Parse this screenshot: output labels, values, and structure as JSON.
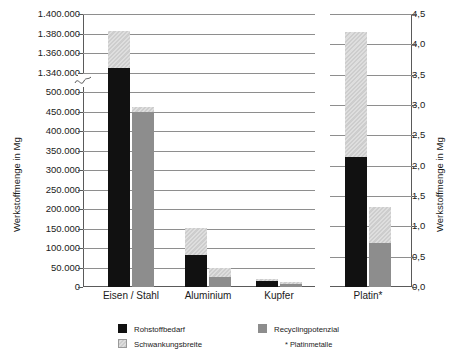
{
  "chart_data": {
    "type": "bar",
    "title": "",
    "categories": [
      "Eisen / Stahl",
      "Aluminium",
      "Kupfer",
      "Platin*"
    ],
    "series": [
      {
        "name": "Rohstoffbedarf",
        "color": "#111111",
        "values": [
          1345000,
          82000,
          15000,
          2.15
        ]
      },
      {
        "name": "Recyclingpotenzial",
        "color": "#8d8d8d",
        "values": [
          450000,
          25000,
          8000,
          0.72
        ]
      },
      {
        "name": "Schwankungsbreite",
        "color": "#d3d3d3",
        "upper_on_rohstoffbedarf": [
          1383000,
          152000,
          20000,
          4.2
        ],
        "upper_on_recyclingpotenzial": [
          462000,
          48000,
          12000,
          1.32
        ]
      }
    ],
    "left_axis": {
      "label": "Werkstoffmenge in Mg",
      "broken": true,
      "lower_segment": {
        "min": 0,
        "max": 500000,
        "step": 50000
      },
      "upper_segment": {
        "min": 1340000,
        "max": 1400000,
        "step": 20000
      },
      "tick_labels": [
        "1.400.000",
        "1.380.000",
        "1.360.000",
        "1.340.000",
        "500.000",
        "450.000",
        "400.000",
        "350.000",
        "300.000",
        "250.000",
        "200.000",
        "150.000",
        "100.000",
        "50.000",
        "0"
      ]
    },
    "right_axis": {
      "label": "Werkstoffmenge in Mg",
      "min": 0.0,
      "max": 4.5,
      "step": 0.5,
      "tick_labels": [
        "4,5",
        "4,0",
        "3,5",
        "3,0",
        "2,5",
        "2,0",
        "1,5",
        "1,0",
        "0,5",
        "0,0"
      ]
    },
    "grid": true,
    "legend_position": "bottom",
    "legend": [
      {
        "label": "Rohstoffbedarf",
        "swatch": "need"
      },
      {
        "label": "Recyclingpotenzial",
        "swatch": "recy"
      },
      {
        "label": "Schwankungsbreite",
        "swatch": "range"
      }
    ],
    "footnote": "* Platinmetalle"
  }
}
